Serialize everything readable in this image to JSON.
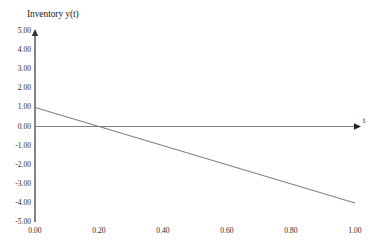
{
  "chart_data": {
    "type": "line",
    "title": "",
    "ylabel": "Inventory y(t)",
    "xlabel": "t",
    "xlim": [
      0.0,
      1.0
    ],
    "ylim": [
      -5.0,
      5.0
    ],
    "grid": false,
    "legend": null,
    "x_ticks": [
      "0.00",
      "0.20",
      "0.40",
      "0.60",
      "0.80",
      "1.00"
    ],
    "x_tick_values": [
      0.0,
      0.2,
      0.4,
      0.6,
      0.8,
      1.0
    ],
    "y_ticks": [
      "5.00",
      "4.00",
      "3.00",
      "2.00",
      "1.00",
      "0.00",
      "-1.00",
      "-2.00",
      "-3.00",
      "-4.00",
      "-5.00"
    ],
    "y_tick_values": [
      5,
      4,
      3,
      2,
      1,
      0,
      -1,
      -2,
      -3,
      -4,
      -5
    ],
    "series": [
      {
        "name": "inventory",
        "color": "#808080",
        "x": [
          0.0,
          0.2,
          1.0
        ],
        "values": [
          1.0,
          0.0,
          -4.0
        ]
      },
      {
        "name": "zero-baseline",
        "color": "#808080",
        "x": [
          0.0,
          1.0
        ],
        "values": [
          0.0,
          0.0
        ]
      }
    ],
    "annotations": [
      {
        "name": "x-intercept",
        "x": 0.2,
        "y": 0.0
      },
      {
        "name": "y-intercept",
        "x": 0.0,
        "y": 1.0
      }
    ]
  },
  "axes": {
    "y_axis_label": "Inventory y(t)",
    "t_axis_label": "t",
    "axis_color": "#333333",
    "line_color": "#808080"
  }
}
